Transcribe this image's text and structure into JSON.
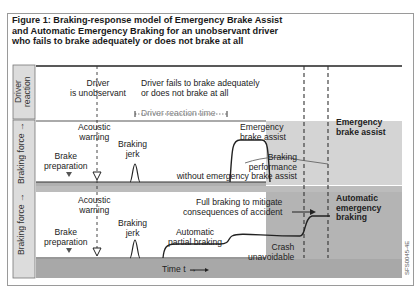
{
  "figure": {
    "title_lines": [
      "Figure 1: Braking-response model of Emergency Brake Assist",
      "and Automatic Emergency Braking for an unobservant driver",
      "who fails to brake adequately or does not brake at all"
    ],
    "code": "SFS0045-4E"
  },
  "axes": {
    "driver_reaction_lines": [
      "Driver",
      "reaction"
    ],
    "braking_force_top": "Braking force →",
    "braking_force_bottom": "Braking force →",
    "time": "Time t →"
  },
  "top_panel": {
    "driver_unobservant": [
      "Driver",
      "is unobservant"
    ],
    "driver_fails": [
      "Driver fails to brake adequately",
      "or does not brake at all"
    ]
  },
  "eba_panel": {
    "acoustic_warning": [
      "Acoustic",
      "warning"
    ],
    "driver_reaction_time": "Driver reaction time",
    "emergency_brake_assist": [
      "Emergency",
      "brake assist"
    ],
    "braking_jerk": [
      "Braking",
      "jerk"
    ],
    "brake_preparation": [
      "Brake",
      "preparation"
    ],
    "braking_performance": [
      "Braking",
      "performance",
      "without emergency brake assist"
    ],
    "side_label": [
      "Emergency",
      "brake assist"
    ]
  },
  "aeb_panel": {
    "acoustic_warning": [
      "Acoustic",
      "warning"
    ],
    "full_braking": [
      "Full braking to mitigate",
      "consequences of accident"
    ],
    "braking_jerk": [
      "Braking",
      "jerk"
    ],
    "automatic_partial_braking": [
      "Automatic",
      "partial braking"
    ],
    "brake_preparation": [
      "Brake",
      "preparation"
    ],
    "crash_unavoidable": [
      "Crash",
      "unavoidable"
    ],
    "side_label": [
      "Automatic",
      "emergency",
      "braking"
    ]
  },
  "colors": {
    "eba_side": "#d4d4d4",
    "aeb_side": "#b4b4b4",
    "axis_strip": "#c8c8c8",
    "time_bar": "#a8a8a8",
    "dark_band": "#909090"
  }
}
